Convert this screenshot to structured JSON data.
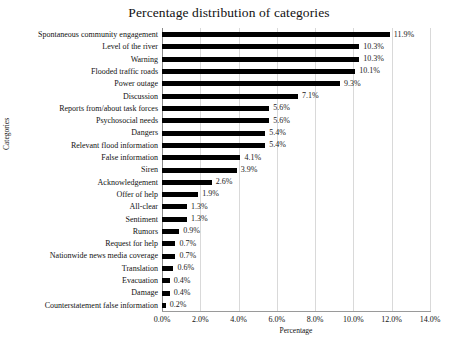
{
  "chart_data": {
    "type": "bar",
    "orientation": "horizontal",
    "title": "Percentage distribution of categories",
    "xlabel": "Percentage",
    "ylabel": "Categories",
    "xlim": [
      0,
      14
    ],
    "xticks": [
      "0.0%",
      "2.0%",
      "4.0%",
      "6.0%",
      "8.0%",
      "10.0%",
      "12.0%",
      "14.0%"
    ],
    "xtick_values": [
      0,
      2,
      4,
      6,
      8,
      10,
      12,
      14
    ],
    "grid": "vertical",
    "legend": "none",
    "bar_color": "#000000",
    "categories": [
      "Spontaneous community engagement",
      "Level of the river",
      "Warning",
      "Flooded traffic roads",
      "Power outage",
      "Discussion",
      "Reports from/about task forces",
      "Psychosocial needs",
      "Dangers",
      "Relevant flood information",
      "False information",
      "Siren",
      "Acknowledgement",
      "Offer of help",
      "All-clear",
      "Sentiment",
      "Rumors",
      "Request for help",
      "Nationwide news media coverage",
      "Translation",
      "Evacuation",
      "Damage",
      "Counterstatement false information"
    ],
    "values": [
      11.9,
      10.3,
      10.3,
      10.1,
      9.3,
      7.1,
      5.6,
      5.6,
      5.4,
      5.4,
      4.1,
      3.9,
      2.6,
      1.9,
      1.3,
      1.3,
      0.9,
      0.7,
      0.7,
      0.6,
      0.4,
      0.4,
      0.2
    ],
    "value_labels": [
      "11.9%",
      "10.3%",
      "10.3%",
      "10.1%",
      "9.3%",
      "7.1%",
      "5.6%",
      "5.6%",
      "5.4%",
      "5.4%",
      "4.1%",
      "3.9%",
      "2.6%",
      "1.9%",
      "1.3%",
      "1.3%",
      "0.9%",
      "0.7%",
      "0.7%",
      "0.6%",
      "0.4%",
      "0.4%",
      "0.2%"
    ]
  }
}
